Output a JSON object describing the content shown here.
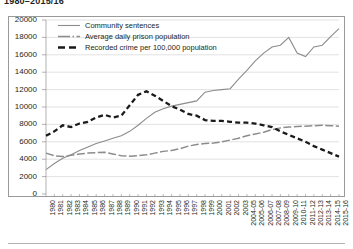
{
  "figure": {
    "title": "1980–2015/16",
    "frame_color": "#9a9a9a",
    "grid_color": "#d5d5d5",
    "background": "#ffffff"
  },
  "legend": {
    "position": "top-left-inside",
    "items": [
      {
        "label": "Community sentences",
        "style": "solid-thin",
        "color": "#8c8c8c",
        "icon": "line-solid-icon"
      },
      {
        "label": "Average daily prison population",
        "style": "long-dash",
        "color": "#8c8c8c",
        "icon": "line-long-dash-icon"
      },
      {
        "label": "Recorded crime per 100,000 population",
        "style": "short-dash-thick",
        "color": "#1a1a1a",
        "icon": "line-short-dash-icon"
      }
    ]
  },
  "axes": {
    "ylabel": "",
    "xlabel": "",
    "ylim": [
      0,
      20000
    ],
    "ytick_step": 2000,
    "yticks": [
      "0",
      "2000",
      "4000",
      "6000",
      "8000",
      "10000",
      "12000",
      "14000",
      "16000",
      "18000",
      "20000"
    ],
    "grid": "horizontal"
  },
  "chart_data": {
    "type": "line",
    "title": "1980–2015/16",
    "xlabel": "",
    "ylabel": "",
    "ylim": [
      0,
      20000
    ],
    "ytick_step": 2000,
    "grid": "horizontal",
    "legend_position": "top-left-inside",
    "categories": [
      "1980",
      "1981",
      "1982",
      "1983",
      "1984",
      "1985",
      "1986",
      "1987",
      "1988",
      "1989",
      "1990",
      "1991",
      "1992",
      "1993",
      "1994",
      "1995",
      "1996",
      "1997",
      "1998",
      "1999",
      "2000",
      "2001",
      "2002",
      "2003",
      "2004-05",
      "2005-06",
      "2006-07",
      "2007-08",
      "2008-09",
      "2009-10",
      "2010-11",
      "2011-12",
      "2012-13",
      "2013-14",
      "2014-15",
      "2015-16"
    ],
    "series": [
      {
        "name": "Community sentences",
        "style": "solid-thin",
        "color": "#8c8c8c",
        "values": [
          2800,
          3500,
          4100,
          4500,
          5000,
          5400,
          5800,
          6100,
          6400,
          6700,
          7200,
          7900,
          8700,
          9400,
          9800,
          10100,
          10300,
          10500,
          10700,
          11700,
          11900,
          12000,
          12100,
          13200,
          14200,
          15300,
          16200,
          16900,
          17100,
          18000,
          16200,
          15800,
          16900,
          17100,
          18100,
          19000
        ]
      },
      {
        "name": "Average daily prison population",
        "style": "long-dash",
        "color": "#8c8c8c",
        "values": [
          4700,
          4400,
          4300,
          4450,
          4600,
          4700,
          4750,
          4800,
          4600,
          4400,
          4350,
          4400,
          4500,
          4700,
          4900,
          5000,
          5200,
          5500,
          5700,
          5800,
          5850,
          6000,
          6200,
          6400,
          6700,
          6900,
          7100,
          7400,
          7600,
          7700,
          7750,
          7800,
          7850,
          7900,
          7850,
          7800
        ]
      },
      {
        "name": "Recorded crime per 100,000 population",
        "style": "short-dash-thick",
        "color": "#1a1a1a",
        "values": [
          6700,
          7200,
          7900,
          7700,
          8100,
          8300,
          8800,
          9100,
          8800,
          9000,
          10200,
          11400,
          11800,
          11300,
          10700,
          10100,
          9700,
          9200,
          9000,
          8500,
          8400,
          8400,
          8300,
          8200,
          8200,
          8100,
          7900,
          7700,
          7200,
          6800,
          6400,
          6000,
          5500,
          5100,
          4700,
          4300
        ]
      }
    ]
  }
}
